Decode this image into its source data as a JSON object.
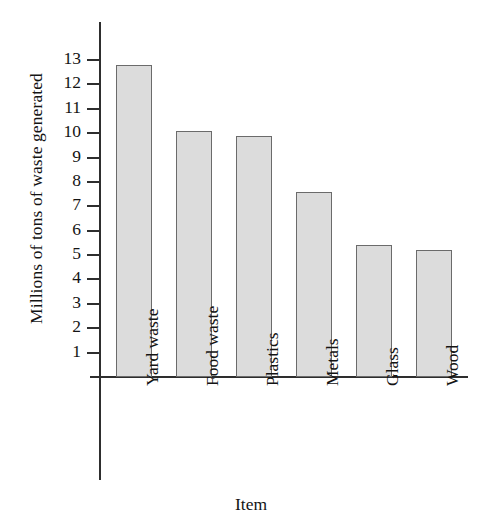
{
  "chart_data": {
    "type": "bar",
    "title": "",
    "xlabel": "Item",
    "ylabel": "Millions of tons of waste generated",
    "categories": [
      "Yard waste",
      "Food waste",
      "Plastics",
      "Metals",
      "Glass",
      "Wood"
    ],
    "values": [
      12.8,
      10.1,
      9.9,
      7.6,
      5.4,
      5.2
    ],
    "ylim": [
      0,
      13.6
    ],
    "yticks": [
      1,
      2,
      3,
      4,
      5,
      6,
      7,
      8,
      9,
      10,
      11,
      12,
      13
    ],
    "ytick_labels": [
      "1",
      "2",
      "3",
      "4",
      "5",
      "6",
      "7",
      "8",
      "9",
      "10",
      "11",
      "12",
      "13"
    ],
    "grid": false,
    "legend": null,
    "bar_fill_color": "#dcdcdc",
    "bar_edge_color": "#6b6b6b",
    "axis_color": "#2e2e2e"
  }
}
